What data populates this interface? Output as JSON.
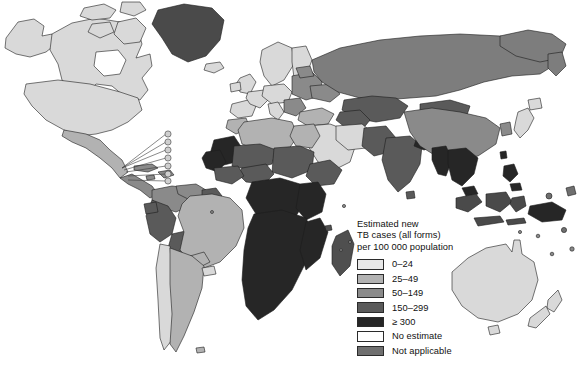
{
  "figure": {
    "type": "choropleth-world-map",
    "background_color": "#ffffff",
    "border_color": "#1c1c1c"
  },
  "legend": {
    "title": "Estimated new\nTB cases (all forms)\nper 100 000 population",
    "title_lines": [
      "Estimated new",
      "TB cases (all forms)",
      "per 100 000 population"
    ],
    "items": [
      {
        "label": "0–24",
        "color": "#e8e8e8",
        "min": 0,
        "max": 24
      },
      {
        "label": "25–49",
        "color": "#b2b2b2",
        "min": 25,
        "max": 49
      },
      {
        "label": "50–149",
        "color": "#8a8a8a",
        "min": 50,
        "max": 149
      },
      {
        "label": "150–299",
        "color": "#5a5a5a",
        "min": 150,
        "max": 299
      },
      {
        "label": "≥ 300",
        "color": "#262626",
        "min": 300,
        "max": null
      },
      {
        "label": "No estimate",
        "color": "#ffffff",
        "min": null,
        "max": null
      },
      {
        "label": "Not applicable",
        "color": "#6f6f6f",
        "min": null,
        "max": null
      }
    ]
  },
  "map_regions": [
    {
      "name": "Canada",
      "class": "0-24",
      "color": "#d9d9d9"
    },
    {
      "name": "United States",
      "class": "0-24",
      "color": "#d9d9d9"
    },
    {
      "name": "Greenland",
      "class": "Not applicable",
      "color": "#4a4a4a"
    },
    {
      "name": "Mexico",
      "class": "25-49",
      "color": "#b2b2b2"
    },
    {
      "name": "Central America",
      "class": "50-149",
      "color": "#8a8a8a"
    },
    {
      "name": "Caribbean islands",
      "class": "50-149",
      "color": "#8a8a8a"
    },
    {
      "name": "Brazil",
      "class": "25-49",
      "color": "#b2b2b2"
    },
    {
      "name": "Peru",
      "class": "150-299",
      "color": "#5a5a5a"
    },
    {
      "name": "Bolivia",
      "class": "150-299",
      "color": "#5a5a5a"
    },
    {
      "name": "Argentina",
      "class": "25-49",
      "color": "#b2b2b2"
    },
    {
      "name": "Chile",
      "class": "0-24",
      "color": "#d9d9d9"
    },
    {
      "name": "Western Europe",
      "class": "0-24",
      "color": "#d9d9d9"
    },
    {
      "name": "Eastern Europe",
      "class": "50-149",
      "color": "#8a8a8a"
    },
    {
      "name": "Russian Federation",
      "class": "50-149",
      "color": "#7d7d7d"
    },
    {
      "name": "Kazakhstan",
      "class": "150-299",
      "color": "#5a5a5a"
    },
    {
      "name": "North Africa",
      "class": "25-49",
      "color": "#b2b2b2"
    },
    {
      "name": "Sahel belt",
      "class": "150-299",
      "color": "#5a5a5a"
    },
    {
      "name": "Sub-Saharan Africa",
      "class": "≥ 300",
      "color": "#262626"
    },
    {
      "name": "South Africa",
      "class": "≥ 300",
      "color": "#262626"
    },
    {
      "name": "Madagascar",
      "class": "150-299",
      "color": "#4f4f4f"
    },
    {
      "name": "Middle East",
      "class": "0-24",
      "color": "#d9d9d9"
    },
    {
      "name": "India",
      "class": "150-299",
      "color": "#5a5a5a"
    },
    {
      "name": "China",
      "class": "50-149",
      "color": "#8a8a8a"
    },
    {
      "name": "Mongolia",
      "class": "150-299",
      "color": "#5a5a5a"
    },
    {
      "name": "Southeast Asia",
      "class": "≥ 300",
      "color": "#262626"
    },
    {
      "name": "Indonesia",
      "class": "150-299",
      "color": "#4a4a4a"
    },
    {
      "name": "Philippines",
      "class": "≥ 300",
      "color": "#262626"
    },
    {
      "name": "Papua New Guinea",
      "class": "≥ 300",
      "color": "#262626"
    },
    {
      "name": "Japan",
      "class": "0-24",
      "color": "#d9d9d9"
    },
    {
      "name": "Australia",
      "class": "0-24",
      "color": "#d9d9d9"
    },
    {
      "name": "New Zealand",
      "class": "0-24",
      "color": "#d9d9d9"
    }
  ]
}
